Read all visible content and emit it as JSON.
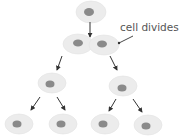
{
  "label": {
    "text": "cell divides"
  },
  "colors": {
    "cytoplasm": "#ececec",
    "cytoplasm_edge": "#e2e2e2",
    "nucleus": "#8a8a8a",
    "arrow": "#333333",
    "label_text": "#555555"
  },
  "generations": [
    {
      "name": "parent",
      "count": 1
    },
    {
      "name": "first-division",
      "count": 2
    },
    {
      "name": "second-generation",
      "count": 2
    },
    {
      "name": "third-generation",
      "count": 4
    }
  ]
}
